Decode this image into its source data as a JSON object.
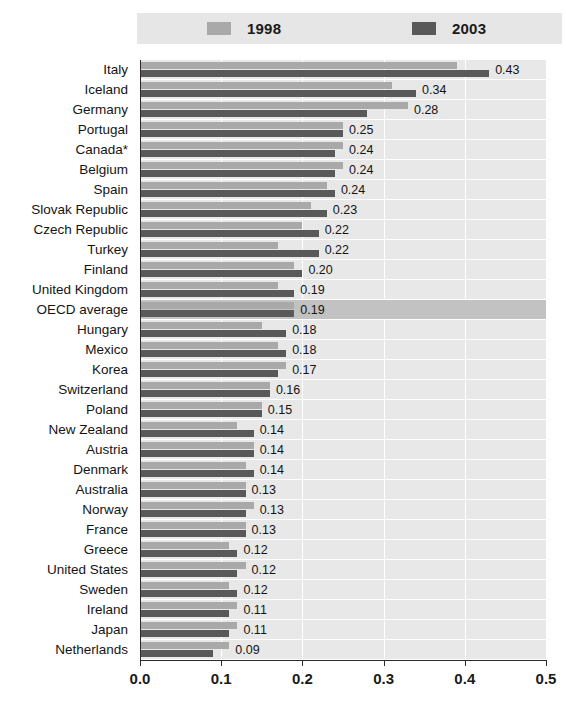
{
  "legend": {
    "entries": [
      {
        "label": "1998",
        "color": "#a9a9a9",
        "icon": "legend-swatch-1998"
      },
      {
        "label": "2003",
        "color": "#595959",
        "icon": "legend-swatch-2003"
      }
    ]
  },
  "axis": {
    "ticks": [
      "0.0",
      "0.1",
      "0.2",
      "0.3",
      "0.4",
      "0.5"
    ],
    "tick_values": [
      0.0,
      0.1,
      0.2,
      0.3,
      0.4,
      0.5
    ]
  },
  "chart_data": {
    "type": "bar",
    "orientation": "horizontal",
    "title": "",
    "subtitle": "",
    "xlabel": "",
    "ylabel": "",
    "xlim": [
      0.0,
      0.5
    ],
    "grid": true,
    "legend_position": "top",
    "categories": [
      "Italy",
      "Iceland",
      "Germany",
      "Portugal",
      "Canada*",
      "Belgium",
      "Spain",
      "Slovak Republic",
      "Czech Republic",
      "Turkey",
      "Finland",
      "United Kingdom",
      "OECD average",
      "Hungary",
      "Mexico",
      "Korea",
      "Switzerland",
      "Poland",
      "New Zealand",
      "Austria",
      "Denmark",
      "Australia",
      "Norway",
      "France",
      "Greece",
      "United States",
      "Sweden",
      "Ireland",
      "Japan",
      "Netherlands"
    ],
    "series": [
      {
        "name": "1998",
        "color": "#a9a9a9",
        "values": [
          0.39,
          0.31,
          0.33,
          0.25,
          0.25,
          0.25,
          0.23,
          0.21,
          0.2,
          0.17,
          0.19,
          0.17,
          0.19,
          0.15,
          0.17,
          0.18,
          0.16,
          0.15,
          0.12,
          0.14,
          0.13,
          0.13,
          0.14,
          0.13,
          0.11,
          0.13,
          0.11,
          0.12,
          0.12,
          0.11
        ]
      },
      {
        "name": "2003",
        "color": "#595959",
        "values": [
          0.43,
          0.34,
          0.28,
          0.25,
          0.24,
          0.24,
          0.24,
          0.23,
          0.22,
          0.22,
          0.2,
          0.19,
          0.19,
          0.18,
          0.18,
          0.17,
          0.16,
          0.15,
          0.14,
          0.14,
          0.14,
          0.13,
          0.13,
          0.13,
          0.12,
          0.12,
          0.12,
          0.11,
          0.11,
          0.09
        ]
      }
    ],
    "data_labels": [
      "0.43",
      "0.34",
      "0.28",
      "0.25",
      "0.24",
      "0.24",
      "0.24",
      "0.23",
      "0.22",
      "0.22",
      "0.20",
      "0.19",
      "0.19",
      "0.18",
      "0.18",
      "0.17",
      "0.16",
      "0.15",
      "0.14",
      "0.14",
      "0.14",
      "0.13",
      "0.13",
      "0.13",
      "0.12",
      "0.12",
      "0.12",
      "0.11",
      "0.11",
      "0.09"
    ],
    "highlight_category": "OECD average",
    "highlight_color": "#c2c2c2",
    "plot_background": "#e8e8e8",
    "note": "Canada*"
  }
}
